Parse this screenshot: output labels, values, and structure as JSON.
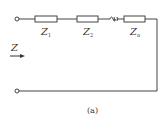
{
  "diagram": {
    "type": "series impedance circuit",
    "input_impedance_label": "Z",
    "components": [
      {
        "symbol": "Z",
        "subscript": "1"
      },
      {
        "symbol": "Z",
        "subscript": "2"
      },
      {
        "symbol": "Z",
        "subscript": "n"
      }
    ],
    "caption": "(a)"
  }
}
